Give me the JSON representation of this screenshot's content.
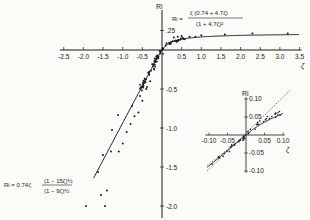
{
  "chart_data": [
    {
      "type": "scatter",
      "title": "",
      "xlabel": "ζ",
      "ylabel": "Ri",
      "xlim": [
        -2.5,
        3.5
      ],
      "ylim": [
        -2.0,
        0.25
      ],
      "grid": false,
      "x_ticks": [
        "-2.5",
        "-2.0",
        "-1.5",
        "-1.0",
        "-0.5",
        "0.5",
        "1.0",
        "1.5",
        "2.0",
        "2.5",
        "3.0",
        "3.5"
      ],
      "y_ticks": [
        ".25",
        "-0.5",
        "-1.0",
        "-1.5",
        "-2.0"
      ],
      "series": [
        {
          "name": "stable fit",
          "kind": "line",
          "equation": "Ri = ζ(0.74 + 4.7ζ) / (1 + 4.7ζ)^2",
          "x": [
            0,
            0.1,
            0.25,
            0.5,
            1.0,
            1.5,
            2.0,
            2.5,
            3.0,
            3.5
          ],
          "y": [
            0,
            0.12,
            0.17,
            0.19,
            0.2,
            0.205,
            0.208,
            0.21,
            0.212,
            0.213
          ]
        },
        {
          "name": "unstable fit",
          "kind": "line",
          "equation": "Ri = 0.74ζ (1 - 15ζ)^1/2 / (1 - 9ζ)^1/2",
          "x": [
            0,
            -0.1,
            -0.25,
            -0.5,
            -0.75,
            -1.0,
            -1.5
          ],
          "y": [
            0,
            -0.1,
            -0.3,
            -0.6,
            -0.95,
            -1.2,
            -1.9
          ]
        },
        {
          "name": "observations",
          "kind": "points",
          "x": [
            0.3,
            0.4,
            0.5,
            0.7,
            0.85,
            1.0,
            1.6,
            2.3,
            3.2,
            -0.1,
            -0.2,
            -0.3,
            -0.4,
            -0.5,
            -0.6,
            -0.7,
            -0.8,
            -0.9,
            -1.0,
            -1.1,
            -1.3,
            -1.4,
            -1.45
          ],
          "y": [
            0.16,
            0.17,
            0.18,
            0.17,
            0.17,
            0.19,
            0.2,
            0.21,
            0.21,
            -0.1,
            -0.25,
            -0.4,
            -0.5,
            -0.65,
            -0.8,
            -0.85,
            -0.95,
            -1.05,
            -1.2,
            -1.3,
            -1.3,
            -1.8,
            -2.0
          ]
        }
      ],
      "annotations": [
        "Ri = ζ(0.74 + 4.7ζ) / (1 + 4.7ζ)²",
        "Ri = 0.74ζ (1 − 15ζ)^½ / (1 − 9ζ)^½"
      ]
    },
    {
      "type": "scatter",
      "title": "inset",
      "xlabel": "ζ",
      "ylabel": "Ri",
      "xlim": [
        -0.1,
        0.1
      ],
      "ylim": [
        -0.1,
        0.1
      ],
      "x_ticks": [
        "-0.10",
        "-0.05",
        "0.05",
        "0.10"
      ],
      "y_ticks": [
        "0.10",
        "0.05",
        "-0.05",
        "-0.10"
      ],
      "series": [
        {
          "name": "fit",
          "kind": "line",
          "x": [
            -0.1,
            0,
            0.1
          ],
          "y": [
            -0.08,
            0,
            0.06
          ]
        },
        {
          "name": "reference 1:1",
          "kind": "dashed",
          "x": [
            -0.1,
            0.12
          ],
          "y": [
            -0.1,
            0.12
          ]
        },
        {
          "name": "reference lower",
          "kind": "dashed",
          "x": [
            -0.1,
            0
          ],
          "y": [
            -0.09,
            0
          ]
        },
        {
          "name": "observations",
          "kind": "points",
          "x": [
            0.02,
            0.03,
            0.04,
            0.05,
            0.06,
            0.07,
            0.08,
            0.09,
            -0.02,
            -0.04,
            -0.06,
            -0.08,
            -0.09,
            -0.1
          ],
          "y": [
            0.02,
            0.03,
            0.035,
            0.04,
            0.045,
            0.05,
            0.055,
            0.06,
            -0.02,
            -0.035,
            -0.05,
            -0.065,
            -0.075,
            -0.085
          ]
        }
      ]
    }
  ],
  "labels": {
    "ri_main": "Ri",
    "zeta_main": "ζ",
    "ri_inset": "Ri",
    "zeta_inset": "ζ",
    "eq_stable_prefix": "Ri =",
    "eq_stable_num": "ζ (0.74 + 4.7ζ)",
    "eq_stable_den": "(1 + 4.7ζ)²",
    "eq_unstable_prefix": "Ri = 0.74ζ",
    "eq_unstable_num": "(1 − 15ζ)½",
    "eq_unstable_den": "(1 − 9ζ)½"
  }
}
